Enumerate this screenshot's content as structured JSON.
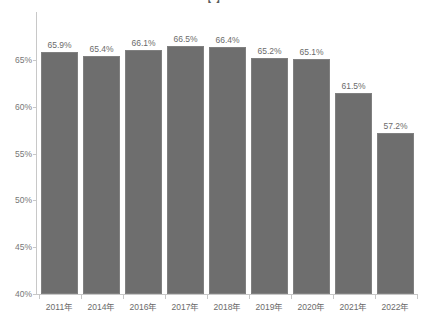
{
  "chart_data": {
    "type": "bar",
    "title": "【  】",
    "title_clipped": true,
    "xlabel": "",
    "ylabel": "",
    "categories": [
      "2011年",
      "2014年",
      "2016年",
      "2017年",
      "2018年",
      "2019年",
      "2020年",
      "2021年",
      "2022年"
    ],
    "values": [
      65.9,
      65.4,
      66.1,
      66.5,
      66.4,
      65.2,
      65.1,
      61.5,
      57.2
    ],
    "data_labels": [
      "65.9%",
      "65.4%",
      "66.1%",
      "66.5%",
      "66.4%",
      "65.2%",
      "65.1%",
      "61.5%",
      "57.2%"
    ],
    "ylim": [
      40,
      67.5
    ],
    "yticks": [
      40,
      45,
      50,
      55,
      60,
      65
    ],
    "ytick_labels": [
      "40%",
      "45%",
      "50%",
      "55%",
      "60%",
      "65%"
    ],
    "grid": false,
    "legend": null,
    "series": [
      {
        "name": "",
        "values": [
          65.9,
          65.4,
          66.1,
          66.5,
          66.4,
          65.2,
          65.1,
          61.5,
          57.2
        ],
        "color": "#6e6e6e"
      }
    ],
    "colors": {
      "bar": "#6e6e6e",
      "bar_border": "#808080",
      "axis": "#c8c8c8",
      "tick_text": "#777777",
      "label_text": "#6b6b6b",
      "background": "#ffffff"
    }
  }
}
